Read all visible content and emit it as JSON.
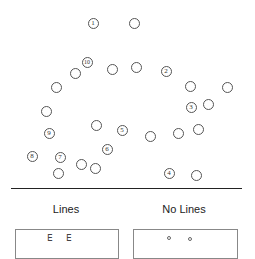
{
  "diagram": {
    "numbered_circles": [
      {
        "label": "1",
        "x": 93,
        "y": 23
      },
      {
        "label": "2",
        "x": 166,
        "y": 71
      },
      {
        "label": "3",
        "x": 191,
        "y": 107
      },
      {
        "label": "4",
        "x": 169,
        "y": 173
      },
      {
        "label": "5",
        "x": 122,
        "y": 130
      },
      {
        "label": "6",
        "x": 107,
        "y": 149
      },
      {
        "label": "7",
        "x": 60,
        "y": 157
      },
      {
        "label": "8",
        "x": 32,
        "y": 156
      },
      {
        "label": "9",
        "x": 49,
        "y": 133
      },
      {
        "label": "10",
        "x": 87,
        "y": 62
      }
    ],
    "plain_circles": [
      {
        "x": 134,
        "y": 23
      },
      {
        "x": 75,
        "y": 73
      },
      {
        "x": 112,
        "y": 69
      },
      {
        "x": 136,
        "y": 67
      },
      {
        "x": 56,
        "y": 87
      },
      {
        "x": 190,
        "y": 86
      },
      {
        "x": 227,
        "y": 87
      },
      {
        "x": 208,
        "y": 104
      },
      {
        "x": 46,
        "y": 111
      },
      {
        "x": 96,
        "y": 125
      },
      {
        "x": 150,
        "y": 136
      },
      {
        "x": 178,
        "y": 133
      },
      {
        "x": 198,
        "y": 129
      },
      {
        "x": 81,
        "y": 164
      },
      {
        "x": 95,
        "y": 168
      },
      {
        "x": 58,
        "y": 173
      },
      {
        "x": 196,
        "y": 175
      }
    ],
    "conditions": [
      {
        "label": "Lines",
        "x": 66
      },
      {
        "label": "No Lines",
        "x": 184
      }
    ]
  }
}
